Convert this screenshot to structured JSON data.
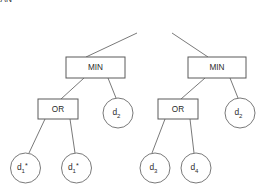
{
  "diagram": {
    "type": "tree",
    "background_color": "#ffffff",
    "box_stroke_color": "#5a5a5a",
    "circle_stroke_color": "#6a6a6a",
    "edge_color": "#6a6a6a",
    "text_color": "#2b2b2b",
    "nodes": [
      {
        "id": "root",
        "shape": "rect",
        "label": "MEAN",
        "label_base": "MEAN",
        "subscript": "",
        "star": "",
        "x": 154.5,
        "y": 22.5,
        "w": 53,
        "h": 21,
        "level": 0
      },
      {
        "id": "min-left",
        "shape": "rect",
        "label": "MIN",
        "label_base": "MIN",
        "subscript": "",
        "star": "",
        "x": 95.5,
        "y": 67.5,
        "w": 59,
        "h": 21,
        "level": 1
      },
      {
        "id": "min-right",
        "shape": "rect",
        "label": "MIN",
        "label_base": "MIN",
        "subscript": "",
        "star": "",
        "x": 217,
        "y": 67.5,
        "w": 58,
        "h": 21,
        "level": 1
      },
      {
        "id": "or-left",
        "shape": "rect",
        "label": "OR",
        "label_base": "OR",
        "subscript": "",
        "star": "",
        "x": 58,
        "y": 109,
        "w": 40,
        "h": 20,
        "level": 2
      },
      {
        "id": "or-right",
        "shape": "rect",
        "label": "OR",
        "label_base": "OR",
        "subscript": "",
        "star": "",
        "x": 178,
        "y": 109,
        "w": 40,
        "h": 20,
        "level": 2
      },
      {
        "id": "leaf-d2-left",
        "shape": "circle",
        "label": "d2",
        "label_base": "d",
        "subscript": "2",
        "star": "",
        "x": 118,
        "y": 113,
        "r": 15,
        "level": 2
      },
      {
        "id": "leaf-d2-right",
        "shape": "circle",
        "label": "d2",
        "label_base": "d",
        "subscript": "2",
        "star": "",
        "x": 240,
        "y": 113,
        "r": 15,
        "level": 2
      },
      {
        "id": "leaf-d1-star-a",
        "shape": "circle",
        "label": "d1*",
        "label_base": "d",
        "subscript": "1",
        "star": "*",
        "x": 25.5,
        "y": 168,
        "r": 15,
        "level": 3
      },
      {
        "id": "leaf-d1-star-b",
        "shape": "circle",
        "label": "d1*",
        "label_base": "d",
        "subscript": "1",
        "star": "*",
        "x": 76.5,
        "y": 168,
        "r": 15,
        "level": 3
      },
      {
        "id": "leaf-d3",
        "shape": "circle",
        "label": "d3",
        "label_base": "d",
        "subscript": "3",
        "star": "",
        "x": 155,
        "y": 168,
        "r": 15,
        "level": 3
      },
      {
        "id": "leaf-d4",
        "shape": "circle",
        "label": "d4",
        "label_base": "d",
        "subscript": "4",
        "star": "",
        "x": 196,
        "y": 168,
        "r": 15,
        "level": 3
      }
    ],
    "edges": [
      {
        "id": "edge-root-min-left",
        "from": "root",
        "to": "min-left",
        "x1": 137,
        "y1": 33,
        "x2": 86,
        "y2": 57
      },
      {
        "id": "edge-root-min-right",
        "from": "root",
        "to": "min-right",
        "x1": 172,
        "y1": 33,
        "x2": 208,
        "y2": 57
      },
      {
        "id": "edge-minL-orL",
        "from": "min-left",
        "to": "or-left",
        "x1": 84,
        "y1": 78,
        "x2": 61,
        "y2": 99
      },
      {
        "id": "edge-minL-d2",
        "from": "min-left",
        "to": "leaf-d2-left",
        "x1": 108,
        "y1": 78,
        "x2": 116,
        "y2": 98
      },
      {
        "id": "edge-minR-orR",
        "from": "min-right",
        "to": "or-right",
        "x1": 205,
        "y1": 78,
        "x2": 181,
        "y2": 99
      },
      {
        "id": "edge-minR-d2",
        "from": "min-right",
        "to": "leaf-d2-right",
        "x1": 230,
        "y1": 78,
        "x2": 238,
        "y2": 98
      },
      {
        "id": "edge-orL-d1a",
        "from": "or-left",
        "to": "leaf-d1-star-a",
        "x1": 45,
        "y1": 119,
        "x2": 29,
        "y2": 153
      },
      {
        "id": "edge-orL-d1b",
        "from": "or-left",
        "to": "leaf-d1-star-b",
        "x1": 70,
        "y1": 119,
        "x2": 75,
        "y2": 153
      },
      {
        "id": "edge-orR-d3",
        "from": "or-right",
        "to": "leaf-d3",
        "x1": 165,
        "y1": 119,
        "x2": 152,
        "y2": 153
      },
      {
        "id": "edge-orR-d4",
        "from": "or-right",
        "to": "leaf-d4",
        "x1": 190,
        "y1": 119,
        "x2": 194,
        "y2": 153
      }
    ]
  }
}
